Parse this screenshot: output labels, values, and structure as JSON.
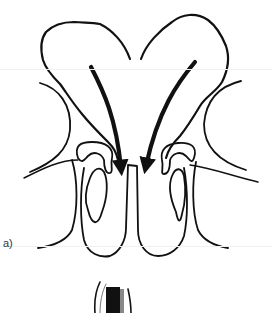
{
  "figure": {
    "panels": [
      {
        "label": "a)",
        "description": "Line drawing of paranasal sinuses (frontal cross-section) with two bold arrows pointing downward toward the nasal septum"
      }
    ],
    "colors": {
      "stroke": "#111111",
      "background": "#ffffff"
    }
  }
}
